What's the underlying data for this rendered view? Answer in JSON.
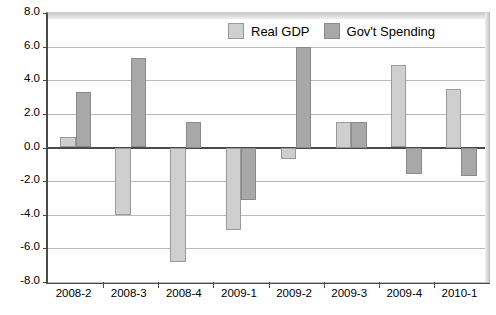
{
  "chart_data": {
    "type": "bar",
    "title": "",
    "subtitle": "",
    "xlabel": "",
    "ylabel": "",
    "categories": [
      "2008-2",
      "2008-3",
      "2008-4",
      "2009-1",
      "2009-2",
      "2009-3",
      "2009-4",
      "2010-1"
    ],
    "series": [
      {
        "name": "Real GDP",
        "color": "#cfcfcf",
        "values": [
          0.6,
          -4.0,
          -6.8,
          -4.9,
          -0.7,
          1.5,
          4.9,
          3.5
        ]
      },
      {
        "name": "Gov't Spending",
        "color": "#a8a8a8",
        "values": [
          3.3,
          5.3,
          1.5,
          -3.1,
          6.0,
          1.5,
          -1.6,
          -1.7
        ]
      }
    ],
    "ylim": [
      -8.0,
      8.0
    ],
    "yticks": [
      8.0,
      6.0,
      4.0,
      2.0,
      0.0,
      -2.0,
      -4.0,
      -6.0,
      -8.0
    ],
    "ytick_labels": [
      "8.0",
      "6.0",
      "4.0",
      "2.0",
      "0.0",
      "-2.0",
      "-4.0",
      "-6.0",
      "-8.0"
    ],
    "grid": true,
    "legend_position": "top-center",
    "annotations": []
  },
  "legend": {
    "items": [
      {
        "label": "Real GDP",
        "swatch_name": "legend-swatch-real-gdp"
      },
      {
        "label": "Gov't Spending",
        "swatch_name": "legend-swatch-govt-spending"
      }
    ]
  }
}
